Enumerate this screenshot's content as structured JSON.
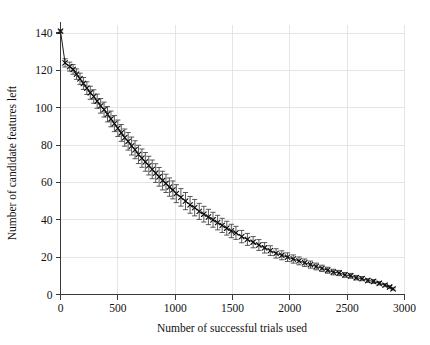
{
  "figure": {
    "background": "#ffffff",
    "ink_color": "#141414",
    "grid_color": "#e2e2e6"
  },
  "chart_data": {
    "type": "line",
    "title": "",
    "subtitle": "",
    "xlabel": "Number of successful trials used",
    "ylabel": "Number of candidate features left",
    "xlim": [
      0,
      3000
    ],
    "ylim": [
      0,
      145
    ],
    "xticks": [
      0,
      500,
      1000,
      1500,
      2000,
      2500,
      3000
    ],
    "xticklabels": [
      "0",
      "500",
      "1000",
      "1500",
      "2000",
      "2500",
      "3000"
    ],
    "yticks": [
      0,
      20,
      40,
      60,
      80,
      100,
      120,
      140
    ],
    "yticklabels": [
      "0",
      "20",
      "40",
      "60",
      "80",
      "100",
      "120",
      "140"
    ],
    "grid": true,
    "grid_axis": "both",
    "legend": false,
    "legend_position": "none",
    "marker": "x-with-caps",
    "error_bars": "symmetric-std-dev-with-caps",
    "series": [
      {
        "name": "candidate features remaining",
        "x": [
          0,
          40,
          80,
          110,
          140,
          170,
          200,
          230,
          260,
          290,
          320,
          350,
          380,
          410,
          440,
          470,
          500,
          530,
          560,
          590,
          620,
          650,
          680,
          710,
          740,
          770,
          800,
          830,
          860,
          890,
          920,
          950,
          980,
          1010,
          1050,
          1090,
          1130,
          1170,
          1210,
          1250,
          1290,
          1330,
          1370,
          1410,
          1450,
          1490,
          1530,
          1580,
          1630,
          1680,
          1730,
          1780,
          1830,
          1880,
          1930,
          1980,
          2030,
          2080,
          2130,
          2180,
          2230,
          2280,
          2330,
          2380,
          2430,
          2480,
          2530,
          2580,
          2630,
          2680,
          2730,
          2780,
          2830,
          2870,
          2900
        ],
        "y": [
          141.0,
          124.0,
          122.0,
          120.5,
          118.0,
          115.5,
          113.0,
          110.5,
          108.0,
          106.0,
          103.5,
          101.0,
          99.0,
          96.5,
          94.0,
          91.5,
          89.0,
          86.5,
          84.0,
          82.0,
          79.5,
          77.5,
          75.0,
          73.0,
          71.0,
          69.0,
          67.0,
          65.0,
          63.0,
          61.0,
          59.5,
          57.5,
          56.0,
          54.0,
          52.0,
          50.0,
          48.0,
          46.5,
          44.5,
          43.0,
          41.5,
          40.0,
          38.5,
          37.0,
          35.5,
          34.0,
          33.0,
          31.0,
          29.5,
          28.0,
          26.5,
          25.0,
          23.5,
          22.0,
          21.0,
          20.0,
          19.0,
          18.0,
          17.0,
          16.0,
          15.0,
          14.0,
          13.0,
          12.0,
          11.5,
          10.5,
          10.0,
          9.0,
          8.5,
          7.5,
          7.0,
          6.0,
          5.0,
          4.0,
          3.0
        ],
        "yerr": [
          0.6,
          2.2,
          2.4,
          2.6,
          2.8,
          3.0,
          3.2,
          3.4,
          3.5,
          3.6,
          3.8,
          3.9,
          4.0,
          4.1,
          4.2,
          4.3,
          4.4,
          4.5,
          4.6,
          4.7,
          4.8,
          4.8,
          4.9,
          4.9,
          5.0,
          5.0,
          5.0,
          5.0,
          5.0,
          5.0,
          4.9,
          4.9,
          4.8,
          4.8,
          4.7,
          4.6,
          4.5,
          4.4,
          4.3,
          4.2,
          4.1,
          4.0,
          3.9,
          3.8,
          3.7,
          3.6,
          3.5,
          3.3,
          3.2,
          3.0,
          2.9,
          2.8,
          2.6,
          2.5,
          2.4,
          2.3,
          2.2,
          2.1,
          2.0,
          1.9,
          1.8,
          1.7,
          1.6,
          1.5,
          1.4,
          1.3,
          1.3,
          1.2,
          1.1,
          1.0,
          1.0,
          0.9,
          0.8,
          0.7,
          0.6
        ]
      }
    ]
  }
}
